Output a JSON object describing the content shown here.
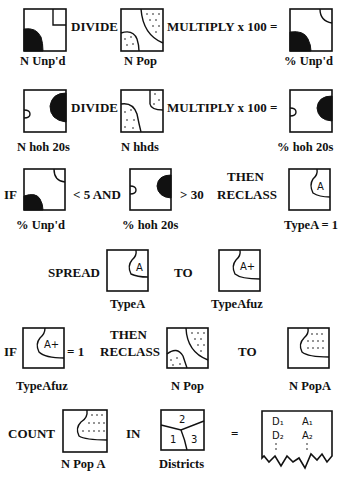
{
  "diagram": {
    "type": "gis-map-algebra-flowchart",
    "rows": [
      {
        "id": "row1",
        "operators": [
          "DIVIDE",
          "MULTIPLY x 100 ="
        ],
        "maps": [
          "N Unp'd",
          "N Pop",
          "% Unp'd"
        ]
      },
      {
        "id": "row2",
        "operators": [
          "DIVIDE",
          "MULTIPLY x 100 ="
        ],
        "maps": [
          "N hoh 20s",
          "N hhds",
          "% hoh 20s"
        ]
      },
      {
        "id": "row3",
        "operators": [
          "IF",
          "< 5  AND",
          "> 30",
          "THEN",
          "RECLASS"
        ],
        "maps": [
          "% Unp'd",
          "% hoh 20s",
          "TypeA = 1"
        ],
        "symbols": [
          "A"
        ]
      },
      {
        "id": "row4",
        "operators": [
          "SPREAD",
          "TO"
        ],
        "maps": [
          "TypeA",
          "TypeAfuz"
        ],
        "symbols": [
          "A",
          "A+"
        ]
      },
      {
        "id": "row5",
        "operators": [
          "IF",
          "= 1",
          "THEN",
          "RECLASS",
          "TO"
        ],
        "maps": [
          "TypeAfuz",
          "N Pop",
          "N PopA"
        ],
        "symbols": [
          "A+"
        ]
      },
      {
        "id": "row6",
        "operators": [
          "COUNT",
          "IN",
          "="
        ],
        "maps": [
          "N Pop A",
          "Districts"
        ],
        "district_numbers": [
          "2",
          "1",
          "3"
        ],
        "output_table": {
          "rows": [
            [
              "D1",
              "A1"
            ],
            [
              "D2",
              "A2"
            ]
          ],
          "continuation": ":"
        }
      }
    ]
  },
  "text": {
    "r1_divide": "DIVIDE",
    "r1_multiply": "MULTIPLY x 100 =",
    "r1_lbl1": "N Unp'd",
    "r1_lbl2": "N Pop",
    "r1_lbl3": "% Unp'd",
    "r2_divide": "DIVIDE",
    "r2_multiply": "MULTIPLY x 100 =",
    "r2_lbl1": "N hoh 20s",
    "r2_lbl2": "N hhds",
    "r2_lbl3": "% hoh 20s",
    "r3_if": "IF",
    "r3_lt5": "< 5  AND",
    "r3_gt30": "> 30",
    "r3_then": "THEN",
    "r3_reclass": "RECLASS",
    "r3_lbl1": "% Unp'd",
    "r3_lbl2": "% hoh 20s",
    "r3_lbl3": "TypeA = 1",
    "r3_sym": "A",
    "r4_spread": "SPREAD",
    "r4_to": "TO",
    "r4_lbl1": "TypeA",
    "r4_lbl2": "TypeAfuz",
    "r4_sym1": "A",
    "r4_sym2": "A+",
    "r5_if": "IF",
    "r5_eq1": "= 1",
    "r5_then": "THEN",
    "r5_reclass": "RECLASS",
    "r5_to": "TO",
    "r5_lbl1": "TypeAfuz",
    "r5_lbl2": "N Pop",
    "r5_lbl3": "N PopA",
    "r5_sym": "A+",
    "r6_count": "COUNT",
    "r6_in": "IN",
    "r6_eq": "=",
    "r6_lbl1": "N Pop A",
    "r6_lbl2": "Districts",
    "r6_d2": "2",
    "r6_d1": "1",
    "r6_d3": "3",
    "r6_tD1": "D₁",
    "r6_tA1": "A₁",
    "r6_tD2": "D₂",
    "r6_tA2": "A₂"
  }
}
